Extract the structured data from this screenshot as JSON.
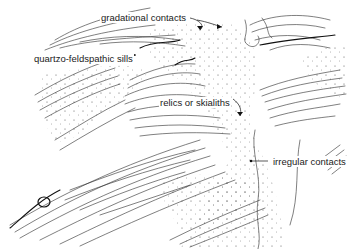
{
  "figure": {
    "ink_color": "#2a2a2a",
    "background": "#ffffff",
    "labels": [
      {
        "id": "gradational",
        "text": "gradational contacts",
        "x": 100,
        "y": 12
      },
      {
        "id": "sills",
        "text": "quartzo-feldspathic sills",
        "x": 33,
        "y": 53
      },
      {
        "id": "relics",
        "text": "relics or skialiths",
        "x": 159,
        "y": 97
      },
      {
        "id": "irregular",
        "text": "irregular contacts",
        "x": 272,
        "y": 157
      }
    ]
  }
}
